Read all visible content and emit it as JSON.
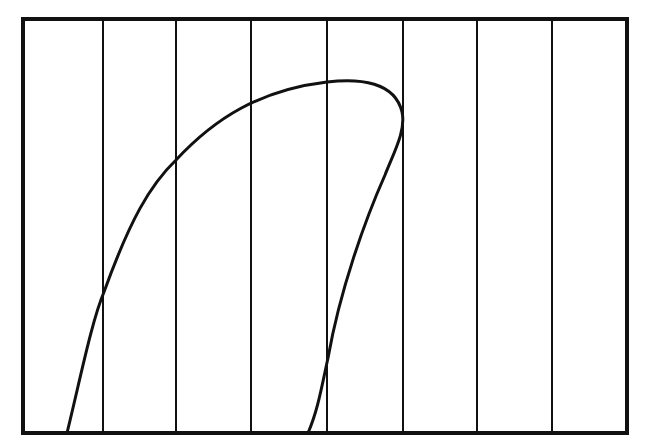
{
  "diagram": {
    "type": "curve-over-vertical-grid",
    "colors": {
      "background": "#ffffff",
      "stroke": "#111111"
    },
    "frame": {
      "x": 23,
      "y": 19,
      "width": 604,
      "height": 414,
      "stroke_width": 4
    },
    "vertical_lines_x": [
      103,
      176,
      251,
      327,
      403,
      477,
      552
    ],
    "vertical_line_count": 7,
    "curve": {
      "description": "Closed-loop-like curve rising from bottom-left, peaking near center, bulging right then descending back to the bottom",
      "path": "M 67 433 C 80 380, 92 320, 104 292 C 130 220, 150 185, 176 160 C 215 118, 260 90, 327 82 C 360 78, 395 82, 402 112 C 406 130, 395 150, 385 175 C 365 220, 340 290, 328 358 C 322 385, 318 410, 308 433",
      "stroke_width": 3,
      "key_points": [
        {
          "x": 67,
          "y": 433,
          "note": "start at bottom edge"
        },
        {
          "x": 104,
          "y": 292,
          "note": "crosses line 1"
        },
        {
          "x": 176,
          "y": 160,
          "note": "crosses line 2"
        },
        {
          "x": 251,
          "y": 100,
          "note": "crosses line 3"
        },
        {
          "x": 340,
          "y": 80,
          "note": "top peak"
        },
        {
          "x": 402,
          "y": 115,
          "note": "rightmost bulge touching line 5"
        },
        {
          "x": 328,
          "y": 358,
          "note": "crosses line 4 descending"
        },
        {
          "x": 308,
          "y": 433,
          "note": "end at bottom edge"
        }
      ]
    }
  }
}
